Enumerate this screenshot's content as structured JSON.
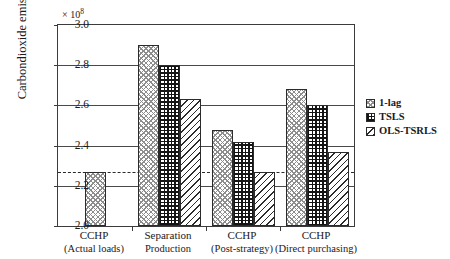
{
  "chart_data": {
    "type": "bar",
    "title": "",
    "xlabel": "",
    "ylabel": "Carbondioxide emission (g)",
    "y_multiplier": "× 10",
    "y_multiplier_exp": "8",
    "ylim": [
      2.0,
      3.0
    ],
    "yticks": [
      "2.0",
      "2.2",
      "2.4",
      "2.6",
      "2.8",
      "3.0"
    ],
    "ytick_values": [
      2.0,
      2.2,
      2.4,
      2.6,
      2.8,
      3.0
    ],
    "grid": "horizontal",
    "legend_position": "right-outside",
    "categories": [
      {
        "line1": "CCHP",
        "line2": "(Actual loads)"
      },
      {
        "line1": "Separation",
        "line2": "Production"
      },
      {
        "line1": "CCHP",
        "line2": "(Post-strategy)"
      },
      {
        "line1": "CCHP",
        "line2": "(Direct purchasing)"
      }
    ],
    "series": [
      {
        "name": "1-lag",
        "pattern": "light-crosshatch",
        "values": [
          2.27,
          2.9,
          2.48,
          2.68
        ]
      },
      {
        "name": "TSLS",
        "pattern": "dense-grid",
        "values": [
          null,
          2.8,
          2.42,
          2.6
        ]
      },
      {
        "name": "OLS-TSRLS",
        "pattern": "diagonal-hatch",
        "values": [
          null,
          2.63,
          2.27,
          2.37
        ]
      }
    ],
    "annotations": [
      {
        "type": "reference-line",
        "style": "dashed",
        "y": 2.27,
        "label": ""
      }
    ]
  }
}
